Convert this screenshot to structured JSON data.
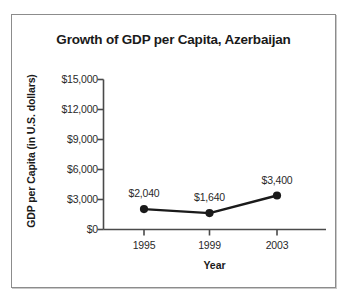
{
  "chart_data": {
    "type": "line",
    "title": "Growth of GDP per Capita, Azerbaijan",
    "xlabel": "Year",
    "ylabel": "GDP per Capita (in U.S. dollars)",
    "categories": [
      "1995",
      "1999",
      "2003"
    ],
    "x": [
      1995,
      1999,
      2003
    ],
    "values": [
      2040,
      1640,
      3400
    ],
    "point_labels": [
      "$2,040",
      "$1,640",
      "$3,400"
    ],
    "series": [
      {
        "name": "GDP per Capita",
        "values": [
          2040,
          1640,
          3400
        ]
      }
    ],
    "ylim": [
      0,
      15000
    ],
    "yticks": [
      0,
      3000,
      6000,
      9000,
      12000,
      15000
    ],
    "ytick_labels": [
      "$0",
      "$3,000",
      "$6,000",
      "$9,000",
      "$12,000",
      "$15,000"
    ],
    "xtick_labels": [
      "1995",
      "1999",
      "2003"
    ],
    "grid": false,
    "legend": false,
    "marker": "filled-circle",
    "line_color": "#1a1a1a",
    "marker_color": "#1a1a1a",
    "axis_color": "#4a4a4a",
    "text_color": "#1a1a1a",
    "background_color": "#ffffff",
    "border_color": "#8c8c8c"
  }
}
